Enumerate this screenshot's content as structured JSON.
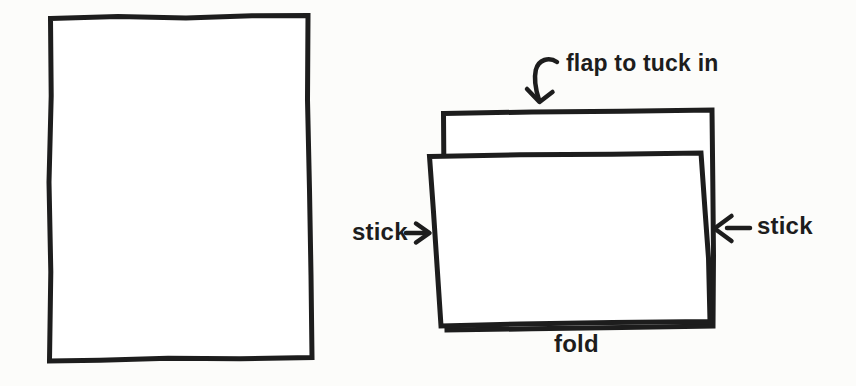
{
  "diagram": {
    "labels": {
      "flap": "flap to tuck in",
      "stick_left": "stick",
      "stick_right": "stick",
      "fold": "fold"
    },
    "colors": {
      "ink": "#1d1d1d",
      "background": "#fcfcfa",
      "paper_fill": "#ffffff"
    },
    "icons": {
      "flap_arrow": "curved-down-arrow-icon",
      "stick_left_arrow": "right-arrow-icon",
      "stick_right_arrow": "left-arrow-icon"
    }
  }
}
